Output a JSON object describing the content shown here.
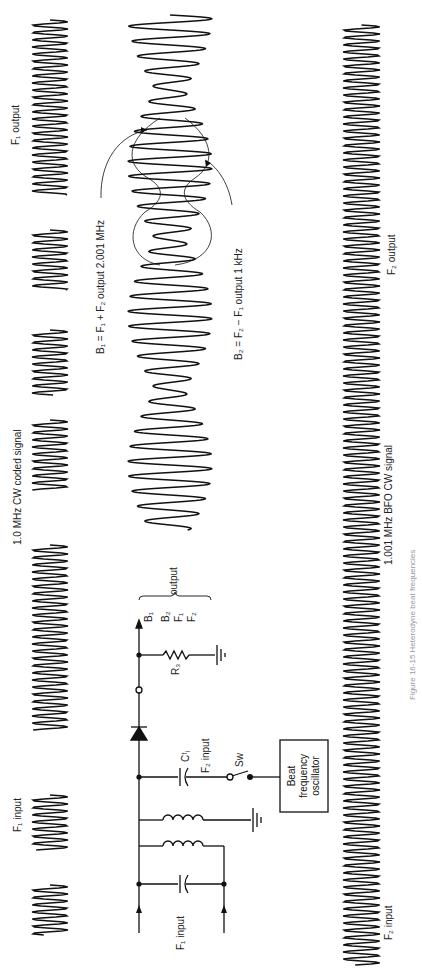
{
  "figure": {
    "caption": "Figure 16-15  Heterodyne beat frequencies",
    "labels": {
      "f1_input_top": "F₁ input",
      "cw_coded": "1.0 MHz CW coded signal",
      "f1_output": "F₁ output",
      "b1_eq": "B₁ = F₁ + F₂ output 2.001 MHz",
      "b2_eq": "B₂ = F₂ − F₁ output 1 kHz",
      "bfo_signal": "1.001 MHz BFO  CW signal",
      "f2_input": "F₂ input",
      "f2_output": "F₂ output",
      "circuit_f1_input": "F₁ input",
      "f2_input_circuit": "F₂ input",
      "cfi": "Cᶠᵢ",
      "r3": "R₃",
      "sw": "Sw",
      "output": "output",
      "outputs_list": [
        "B₁",
        "B₂",
        "F₁",
        "F₂"
      ],
      "bfo_box": [
        "Beat",
        "frequency",
        "oscillator"
      ]
    },
    "signals": {
      "f1_bursts_y": [
        [
          20,
          195
        ],
        [
          230,
          290
        ],
        [
          330,
          395
        ],
        [
          420,
          490
        ],
        [
          545,
          730
        ],
        [
          795,
          850
        ],
        [
          885,
          935
        ]
      ],
      "f2_range_y": [
        25,
        965
      ],
      "beat_range_y": [
        15,
        530
      ]
    }
  }
}
